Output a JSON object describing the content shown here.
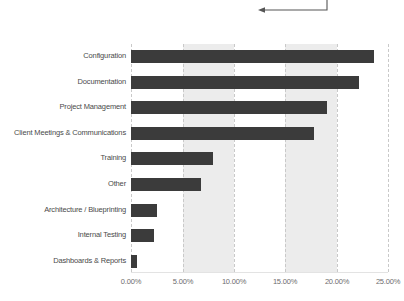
{
  "chart_data": {
    "type": "bar",
    "orientation": "horizontal",
    "title": "",
    "subtitle": "",
    "xlabel": "",
    "ylabel": "",
    "xlim": [
      0,
      25
    ],
    "xticks": [
      0,
      5,
      10,
      15,
      20,
      25
    ],
    "xticklabels": [
      "0.00%",
      "5.00%",
      "10.00%",
      "15.00%",
      "20.00%",
      "25.00%"
    ],
    "value_format": "percent",
    "grid": "vertical-dashed",
    "legend": "none",
    "bar_color": "#3b3b3b",
    "band_color": "#ececec",
    "gridline_color": "#c9c9c9",
    "shaded_bands": [
      [
        5,
        10
      ],
      [
        15,
        20
      ]
    ],
    "categories": [
      "Configuration",
      "Documentation",
      "Project Management",
      "Client Meetings & Communications",
      "Training",
      "Other",
      "Architecture / Blueprinting",
      "Internal Testing",
      "Dashboards & Reports"
    ],
    "values": [
      23.6,
      22.2,
      19.1,
      17.8,
      8.0,
      6.8,
      2.5,
      2.2,
      0.6
    ],
    "annotations": [
      {
        "name": "callout-arrow",
        "type": "arrow",
        "direction": "left",
        "text": ""
      }
    ]
  }
}
